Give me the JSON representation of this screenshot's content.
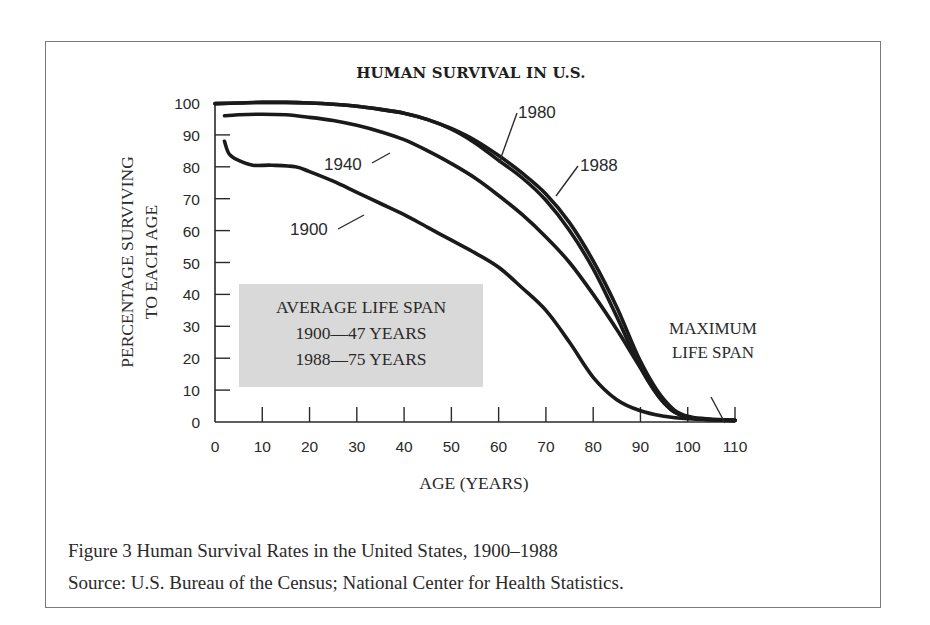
{
  "figure": {
    "title": "HUMAN SURVIVAL IN U.S.",
    "caption": "Figure 3   Human Survival Rates in the United States, 1900–1988",
    "source": "Source: U.S. Bureau of the Census; National Center for Health Statistics.",
    "ylabel_line1": "PERCENTAGE SURVIVING",
    "ylabel_line2": "TO EACH AGE",
    "xlabel": "AGE (YEARS)",
    "annotation_box": {
      "line1": "AVERAGE LIFE SPAN",
      "line2": "1900—47 YEARS",
      "line3": "1988—75 YEARS",
      "fill": "#d9d9d9"
    },
    "max_lifespan_label_1": "MAXIMUM",
    "max_lifespan_label_2": "LIFE SPAN",
    "series_labels": {
      "s1900": "1900",
      "s1940": "1940",
      "s1980": "1980",
      "s1988": "1988"
    }
  },
  "chart_data": {
    "type": "line",
    "title": "HUMAN SURVIVAL IN U.S.",
    "xlabel": "AGE (YEARS)",
    "ylabel": "PERCENTAGE SURVIVING TO EACH AGE",
    "xlim": [
      0,
      110
    ],
    "ylim": [
      0,
      100
    ],
    "xticks": [
      0,
      10,
      20,
      30,
      40,
      50,
      60,
      70,
      80,
      90,
      100,
      110
    ],
    "yticks": [
      0,
      10,
      20,
      30,
      40,
      50,
      60,
      70,
      80,
      90,
      100
    ],
    "grid": false,
    "legend": "inline labels",
    "series": [
      {
        "name": "1900",
        "x": [
          2,
          3,
          5,
          8,
          12,
          17,
          20,
          25,
          30,
          35,
          40,
          45,
          50,
          55,
          60,
          65,
          70,
          75,
          80,
          85,
          90,
          95,
          100,
          110
        ],
        "y": [
          88,
          84,
          82,
          80.5,
          80.5,
          80,
          78.5,
          75.5,
          72,
          68.5,
          65,
          61,
          57,
          53,
          48.5,
          42,
          35,
          25,
          14,
          7,
          3.5,
          1.8,
          1,
          0.5
        ]
      },
      {
        "name": "1940",
        "x": [
          2,
          5,
          10,
          15,
          20,
          25,
          30,
          35,
          40,
          45,
          50,
          55,
          60,
          65,
          70,
          75,
          80,
          85,
          90,
          95,
          100,
          110
        ],
        "y": [
          96,
          96.3,
          96.5,
          96.3,
          95.5,
          94.5,
          93,
          91,
          88.5,
          85,
          81,
          76.5,
          71,
          65,
          58,
          50,
          40,
          29,
          17,
          6,
          1.5,
          0.5
        ]
      },
      {
        "name": "1980",
        "x": [
          0,
          5,
          10,
          15,
          20,
          25,
          30,
          35,
          40,
          45,
          50,
          55,
          60,
          65,
          70,
          75,
          80,
          85,
          90,
          95,
          100,
          110
        ],
        "y": [
          99.8,
          100,
          100.2,
          100.2,
          100,
          99.6,
          99,
          98,
          96.8,
          94.8,
          91.8,
          87.5,
          82,
          76.5,
          69.5,
          60,
          48,
          33,
          17,
          6,
          1.5,
          0.5
        ]
      },
      {
        "name": "1988",
        "x": [
          0,
          5,
          10,
          15,
          20,
          25,
          30,
          35,
          40,
          45,
          50,
          55,
          60,
          65,
          70,
          75,
          80,
          85,
          90,
          95,
          100,
          110
        ],
        "y": [
          99.8,
          100,
          100.2,
          100.2,
          100,
          99.6,
          99,
          98,
          96.8,
          94.8,
          92,
          88.3,
          83.5,
          78,
          71.5,
          62.5,
          50.5,
          36,
          19,
          7,
          1.8,
          0.5
        ]
      }
    ],
    "annotations": [
      "AVERAGE LIFE SPAN 1900—47 YEARS 1988—75 YEARS",
      "MAXIMUM LIFE SPAN (at age 110)"
    ]
  }
}
